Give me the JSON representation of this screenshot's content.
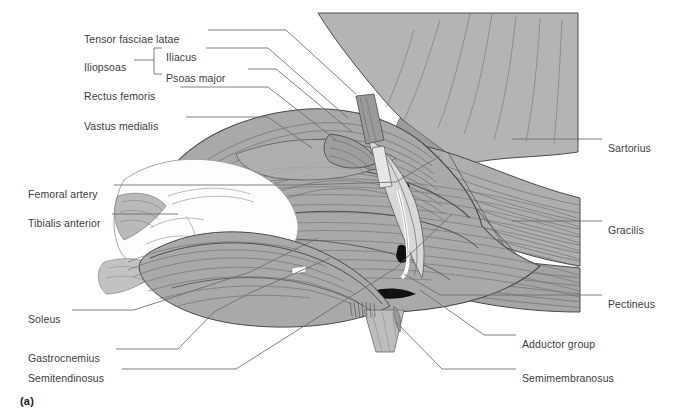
{
  "figure": {
    "caption": "(a)",
    "colors": {
      "muscle_fill": "#a9a9a9",
      "muscle_fill_light": "#bcbcbc",
      "muscle_fill_dark": "#8f8f8f",
      "torso_fill": "#b4b4b4",
      "highlight_white": "#fdfdfd",
      "striation": "#6e6e6e",
      "outline": "#4a4a4a",
      "accent_black": "#111111",
      "leader_line": "#6f6f6f",
      "label_text": "#3b3b3b",
      "background": "#ffffff"
    }
  },
  "labels_left": [
    {
      "id": "tensor-fasciae-latae",
      "text": "Tensor fasciae latae",
      "x": 84,
      "y": 33
    },
    {
      "id": "iliopsoas",
      "text": "Iliopsoas",
      "x": 84,
      "y": 61
    },
    {
      "id": "iliacus",
      "text": "Iliacus",
      "x": 166,
      "y": 51
    },
    {
      "id": "psoas-major",
      "text": "Psoas major",
      "x": 166,
      "y": 72
    },
    {
      "id": "rectus-femoris",
      "text": "Rectus femoris",
      "x": 84,
      "y": 90
    },
    {
      "id": "vastus-medialis",
      "text": "Vastus medialis",
      "x": 84,
      "y": 120
    },
    {
      "id": "femoral-artery",
      "text": "Femoral artery",
      "x": 28,
      "y": 188
    },
    {
      "id": "tibialis-anterior",
      "text": "Tibialis anterior",
      "x": 28,
      "y": 217
    },
    {
      "id": "soleus",
      "text": "Soleus",
      "x": 28,
      "y": 313
    },
    {
      "id": "gastrocnemius",
      "text": "Gastrocnemius",
      "x": 28,
      "y": 352
    },
    {
      "id": "semitendinosus",
      "text": "Semitendinosus",
      "x": 28,
      "y": 372
    }
  ],
  "labels_right": [
    {
      "id": "sartorius",
      "text": "Sartorius",
      "x": 608,
      "y": 142
    },
    {
      "id": "gracilis",
      "text": "Gracilis",
      "x": 608,
      "y": 224
    },
    {
      "id": "pectineus",
      "text": "Pectineus",
      "x": 608,
      "y": 298
    },
    {
      "id": "adductor-group",
      "text": "Adductor group",
      "x": 522,
      "y": 338
    },
    {
      "id": "semimembranosus",
      "text": "Semimembranosus",
      "x": 522,
      "y": 372
    }
  ]
}
